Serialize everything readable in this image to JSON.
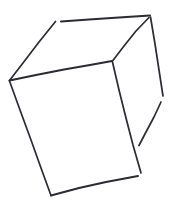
{
  "canvas": {
    "width": 177,
    "height": 215,
    "background_color": "#ffffff",
    "title": "hand-drawn cube sketch"
  },
  "drawing": {
    "name": "cube-wireframe-sketch",
    "subject": "cube",
    "style": "hand-drawn line sketch",
    "stroke_color": "#2b2b33",
    "stroke_width": 1.7,
    "fill": "none",
    "line_count": 9,
    "strokes": [
      {
        "name": "back-top-left-edge",
        "description": "diagonal from left vertex up-right to back top-left corner",
        "color": "#2b2b33",
        "width": 1.7,
        "points": "9.5,80.5 23,63 39,42 55.5,21.5"
      },
      {
        "name": "back-top-edge",
        "description": "near-horizontal top edge running right, slightly rising",
        "color": "#2b2b33",
        "width": 2.0,
        "points": "61,21.5 89,19.5 119,17.5 150,15.5"
      },
      {
        "name": "back-top-right-edge",
        "description": "diagonal from back top-right corner down-left to front-top-right vertex",
        "color": "#2b2b33",
        "width": 1.7,
        "points": "149,17.5 136,31 124,46 112.5,61"
      },
      {
        "name": "right-upper-vertical-edge",
        "description": "right side edge descending from top-right corner, broken partway",
        "color": "#2b2b33",
        "width": 1.7,
        "points": "150.5,17 155,44 159,70 163,96"
      },
      {
        "name": "right-lower-back-edge",
        "description": "lower right back edge sloping down-left after the gap",
        "color": "#2b2b33",
        "width": 1.7,
        "points": "161,102 154,117 146,132 139,145.5"
      },
      {
        "name": "front-top-edge",
        "description": "top edge of front face, slightly bowed, left vertex to front-top-right vertex",
        "color": "#2b2b33",
        "width": 2.0,
        "points": "9.5,80.5 36,75 64,69.5 90,65 112,61"
      },
      {
        "name": "front-left-edge",
        "description": "left edge of front face descending to bottom-left corner",
        "color": "#2b2b33",
        "width": 1.7,
        "points": "9.5,81 20,110 31,140 41,168 51,195.5"
      },
      {
        "name": "front-right-edge",
        "description": "right edge of front face descending from front-top-right vertex",
        "color": "#2b2b33",
        "width": 1.7,
        "points": "112.5,62 119,90 126,118 133,145 141,173"
      },
      {
        "name": "front-bottom-edge",
        "description": "bottom edge of front face rising slightly to the right",
        "color": "#2b2b33",
        "width": 2.0,
        "points": "51,195.5 79,188 106,182 138,176"
      }
    ],
    "vertices": [
      {
        "name": "left-vertex",
        "x": 9,
        "y": 80
      },
      {
        "name": "back-top-left-vertex",
        "x": 56,
        "y": 21
      },
      {
        "name": "back-top-right-vertex",
        "x": 150,
        "y": 16
      },
      {
        "name": "front-top-right-vertex",
        "x": 112,
        "y": 61
      },
      {
        "name": "front-bottom-left-vertex",
        "x": 51,
        "y": 195
      },
      {
        "name": "front-bottom-right-vertex",
        "x": 139,
        "y": 175
      },
      {
        "name": "back-bottom-right-vertex",
        "x": 139,
        "y": 145
      }
    ]
  }
}
